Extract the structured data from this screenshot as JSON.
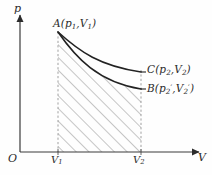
{
  "figure": {
    "background_color": "#fefefe",
    "stroke_color": "#2b2b2b",
    "hatch_color": "#8a8a8a",
    "dashed_color": "#9a9a9a"
  },
  "axes": {
    "y_label": "p",
    "x_label": "V",
    "origin_label": "O",
    "x_ticks": [
      {
        "label": "V",
        "sub": "1",
        "x": 58
      },
      {
        "label": "V",
        "sub": "2",
        "x": 141
      }
    ],
    "x_axis_y": 152,
    "y_axis_x": 20,
    "x_axis_start": 20,
    "x_axis_end": 203,
    "y_axis_top": 14
  },
  "points": {
    "A": {
      "name": "A",
      "text": "A(p",
      "sub1": "1",
      "mid": ",V",
      "sub2": "1",
      "close": ")",
      "x": 58,
      "y": 32
    },
    "C": {
      "name": "C",
      "text": "C(p",
      "sub1": "2",
      "mid": ",V",
      "sub2": "2",
      "close": ")",
      "x": 141,
      "y": 72
    },
    "B": {
      "name": "B",
      "text": "B(p",
      "sub1": "2",
      "prime1": "′",
      "mid": ",V",
      "sub2": "2",
      "prime2": "′",
      "close": ")",
      "x": 141,
      "y": 89
    }
  },
  "curves": {
    "upper": {
      "name": "isothermal-curve-A-to-C",
      "path": "M 58 32 C 80 52, 100 66, 141 72"
    },
    "lower": {
      "name": "adiabatic-curve-A-to-B",
      "path": "M 58 32 C 76 58, 98 82, 141 89"
    }
  },
  "hatching": {
    "region_name": "work-area-under-curve",
    "direction": "bottom-left-to-top-right",
    "angle_deg": 45,
    "spacing_px": 9
  }
}
